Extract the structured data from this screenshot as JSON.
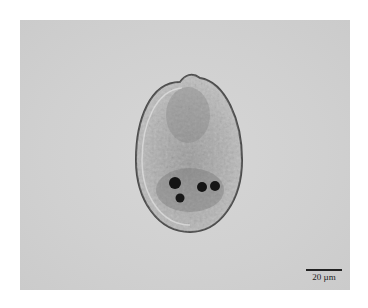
{
  "image": {
    "description": "Brightfield micrograph of an ovoid ciliate cell with granular cytoplasm and several dark inclusions",
    "background_color": "#d2d2d2"
  },
  "scale_bar": {
    "label": "20 µm"
  }
}
